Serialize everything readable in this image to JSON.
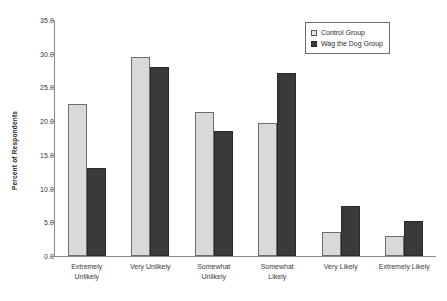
{
  "chart_data": {
    "type": "bar",
    "title": "",
    "xlabel": "",
    "ylabel": "Percent of Respondents",
    "ylim": [
      0,
      35
    ],
    "ytick_step": 5,
    "ytick_labels": [
      "35.0",
      "30.0",
      "25.0",
      "20.0",
      "15.0",
      "10.0",
      "5.0",
      "0.0"
    ],
    "grid": false,
    "legend_position": "top-right",
    "categories": [
      "Extremely Unlikely",
      "Very Unlikely",
      "Somewhat Unlikely",
      "Somewhat Likely",
      "Very Likely",
      "Extremely Likely"
    ],
    "category_lines": [
      [
        "Extremely",
        "Unlikely"
      ],
      [
        "Very Unlikely"
      ],
      [
        "Somewhat",
        "Unlikely"
      ],
      [
        "Somewhat",
        "Likely"
      ],
      [
        "Very Likely"
      ],
      [
        "Extremely Likely"
      ]
    ],
    "series": [
      {
        "name": "Control Group",
        "color": "#d9d9d9",
        "values": [
          22.6,
          29.5,
          21.4,
          19.7,
          3.6,
          2.9
        ]
      },
      {
        "name": "Wag the Dog Group",
        "color": "#3a3a3a",
        "values": [
          13.0,
          28.1,
          18.5,
          27.1,
          7.4,
          5.2
        ]
      }
    ]
  },
  "legend": {
    "items": [
      {
        "label": "Control Group"
      },
      {
        "label": "Wag the Dog Group"
      }
    ]
  }
}
